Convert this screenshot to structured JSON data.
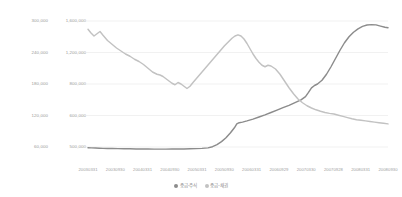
{
  "chart_data": {
    "type": "line",
    "title": "",
    "xlabel": "",
    "ylabel": "",
    "grid": true,
    "legend_position": "bottom-center",
    "x": [
      "20030331",
      "20030930",
      "20040331",
      "20040930",
      "20050331",
      "20050930",
      "20060331",
      "20060929",
      "20070330",
      "20070928",
      "20080331",
      "20080930"
    ],
    "axes": {
      "left": {
        "name": "equity-axis",
        "ticks": [
          "300,000",
          "240,000",
          "180,000",
          "120,000",
          "60,000"
        ],
        "values": [
          300000,
          240000,
          180000,
          120000,
          60000
        ],
        "ylim": [
          0,
          330000
        ]
      },
      "inner": {
        "name": "bond-axis",
        "ticks": [
          "1,600,000",
          "1,200,000",
          "800,000",
          "600,000",
          "500,000"
        ],
        "values": [
          1600000,
          1200000,
          800000,
          600000,
          500000
        ],
        "ylim": [
          0,
          1750000
        ]
      }
    },
    "series": [
      {
        "name": "fund-equity",
        "label": "중금-주식",
        "color": "#8c8c8c",
        "axis": "left",
        "points": [
          [
            0.0,
            9.5
          ],
          [
            1.2,
            9.4
          ],
          [
            2.5,
            9.3
          ],
          [
            3.8,
            9.2
          ],
          [
            5.0,
            9.1
          ],
          [
            6.5,
            9.0
          ],
          [
            8.0,
            9.0
          ],
          [
            10.0,
            8.9
          ],
          [
            12.0,
            8.8
          ],
          [
            14.0,
            8.8
          ],
          [
            16.0,
            8.7
          ],
          [
            18.0,
            8.7
          ],
          [
            20.0,
            8.7
          ],
          [
            22.0,
            8.6
          ],
          [
            24.0,
            8.6
          ],
          [
            26.0,
            8.6
          ],
          [
            28.0,
            8.7
          ],
          [
            30.0,
            8.7
          ],
          [
            32.0,
            8.7
          ],
          [
            34.0,
            8.8
          ],
          [
            36.0,
            8.9
          ],
          [
            38.0,
            9.1
          ],
          [
            40.0,
            9.4
          ],
          [
            41.5,
            10.2
          ],
          [
            43.0,
            11.6
          ],
          [
            44.5,
            13.6
          ],
          [
            46.0,
            16.2
          ],
          [
            47.5,
            19.5
          ],
          [
            48.8,
            22.8
          ],
          [
            49.6,
            25.4
          ],
          [
            50.4,
            26.2
          ],
          [
            51.5,
            26.6
          ],
          [
            53.0,
            27.4
          ],
          [
            55.0,
            28.6
          ],
          [
            57.0,
            30.0
          ],
          [
            59.0,
            31.4
          ],
          [
            61.0,
            33.0
          ],
          [
            63.0,
            34.6
          ],
          [
            65.0,
            36.2
          ],
          [
            67.0,
            37.8
          ],
          [
            69.0,
            39.6
          ],
          [
            71.0,
            41.4
          ],
          [
            72.5,
            43.6
          ],
          [
            73.5,
            46.4
          ],
          [
            74.5,
            49.4
          ],
          [
            75.5,
            51.0
          ],
          [
            76.5,
            52.0
          ],
          [
            78.0,
            54.5
          ],
          [
            79.5,
            58.5
          ],
          [
            81.0,
            63.5
          ],
          [
            82.5,
            69.0
          ],
          [
            84.0,
            74.5
          ],
          [
            85.5,
            79.5
          ],
          [
            87.0,
            83.5
          ],
          [
            88.5,
            86.5
          ],
          [
            90.0,
            88.8
          ],
          [
            91.5,
            90.4
          ],
          [
            93.0,
            91.3
          ],
          [
            94.5,
            91.6
          ],
          [
            96.0,
            91.4
          ],
          [
            97.5,
            90.6
          ],
          [
            99.0,
            89.8
          ],
          [
            100.0,
            89.5
          ]
        ]
      },
      {
        "name": "fund-bond",
        "label": "중금-채권",
        "color": "#c2c2c2",
        "axis": "inner",
        "points": [
          [
            0.0,
            88.5
          ],
          [
            1.0,
            86.0
          ],
          [
            2.0,
            84.0
          ],
          [
            3.0,
            85.5
          ],
          [
            4.0,
            87.0
          ],
          [
            5.0,
            84.5
          ],
          [
            6.5,
            81.0
          ],
          [
            8.0,
            78.5
          ],
          [
            9.5,
            76.0
          ],
          [
            11.0,
            74.0
          ],
          [
            12.5,
            72.0
          ],
          [
            14.0,
            70.5
          ],
          [
            15.5,
            68.5
          ],
          [
            17.0,
            67.0
          ],
          [
            18.5,
            65.0
          ],
          [
            20.0,
            62.5
          ],
          [
            21.5,
            60.0
          ],
          [
            23.0,
            58.5
          ],
          [
            24.0,
            58.0
          ],
          [
            25.0,
            57.0
          ],
          [
            26.0,
            55.5
          ],
          [
            27.0,
            54.0
          ],
          [
            28.0,
            52.5
          ],
          [
            29.0,
            51.5
          ],
          [
            30.0,
            53.0
          ],
          [
            31.0,
            52.0
          ],
          [
            32.0,
            50.5
          ],
          [
            33.0,
            49.0
          ],
          [
            34.0,
            50.5
          ],
          [
            35.0,
            53.0
          ],
          [
            36.5,
            56.5
          ],
          [
            38.0,
            60.0
          ],
          [
            39.5,
            63.5
          ],
          [
            41.0,
            67.0
          ],
          [
            42.5,
            70.5
          ],
          [
            44.0,
            74.0
          ],
          [
            45.5,
            77.5
          ],
          [
            47.0,
            80.5
          ],
          [
            48.0,
            82.5
          ],
          [
            49.0,
            84.0
          ],
          [
            50.0,
            84.8
          ],
          [
            51.0,
            84.0
          ],
          [
            52.0,
            82.0
          ],
          [
            53.0,
            79.0
          ],
          [
            54.0,
            75.5
          ],
          [
            55.0,
            72.0
          ],
          [
            56.0,
            69.0
          ],
          [
            57.0,
            66.5
          ],
          [
            58.0,
            64.5
          ],
          [
            59.0,
            63.5
          ],
          [
            60.0,
            64.5
          ],
          [
            61.0,
            64.0
          ],
          [
            62.5,
            62.0
          ],
          [
            64.0,
            58.5
          ],
          [
            65.5,
            54.0
          ],
          [
            67.0,
            49.5
          ],
          [
            68.5,
            45.5
          ],
          [
            70.0,
            42.0
          ],
          [
            71.5,
            39.5
          ],
          [
            73.0,
            37.5
          ],
          [
            74.5,
            36.0
          ],
          [
            76.0,
            34.8
          ],
          [
            77.5,
            33.8
          ],
          [
            79.0,
            33.0
          ],
          [
            80.5,
            32.4
          ],
          [
            82.0,
            32.0
          ],
          [
            83.5,
            31.2
          ],
          [
            85.0,
            30.4
          ],
          [
            86.5,
            29.6
          ],
          [
            88.0,
            28.8
          ],
          [
            89.5,
            28.2
          ],
          [
            91.0,
            27.8
          ],
          [
            92.5,
            27.4
          ],
          [
            94.0,
            27.0
          ],
          [
            95.5,
            26.6
          ],
          [
            97.0,
            26.2
          ],
          [
            98.5,
            25.8
          ],
          [
            100.0,
            25.4
          ]
        ]
      }
    ],
    "legend": [
      "중금-주식",
      "중금-채권"
    ]
  },
  "colors": {
    "background": "#ffffff",
    "grid": "#ebebeb",
    "axis_text": "#9a9a9a",
    "series_equity": "#8c8c8c",
    "series_bond": "#c2c2c2"
  }
}
